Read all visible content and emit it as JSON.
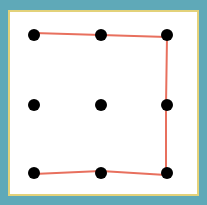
{
  "puzzle": {
    "name": "nine-dot-puzzle",
    "colors": {
      "frame": "#5fa9b8",
      "inner_border": "#e3d27a",
      "background": "#ffffff",
      "dot": "#000000",
      "line": "#e8705e"
    },
    "dots": [
      {
        "x": 34,
        "y": 35
      },
      {
        "x": 101,
        "y": 35
      },
      {
        "x": 167,
        "y": 35
      },
      {
        "x": 34,
        "y": 105
      },
      {
        "x": 101,
        "y": 105
      },
      {
        "x": 167,
        "y": 105
      },
      {
        "x": 34,
        "y": 173
      },
      {
        "x": 101,
        "y": 173
      },
      {
        "x": 167,
        "y": 173
      }
    ],
    "path": "34,33 101,35 167,37 166,105 166,175 101,171 34,174"
  }
}
